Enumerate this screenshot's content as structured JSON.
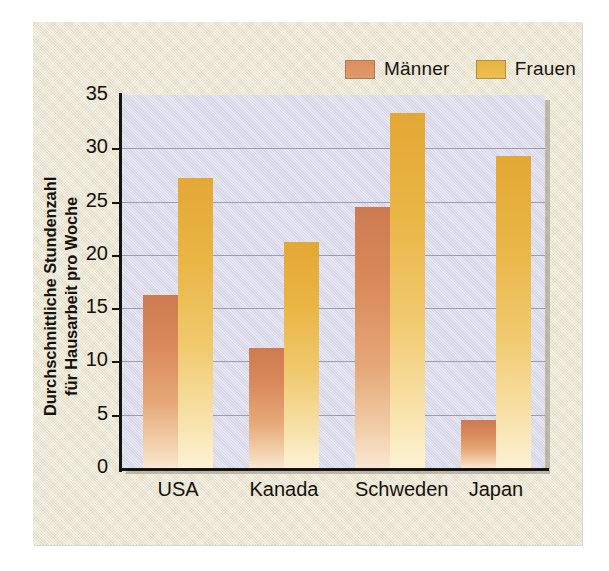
{
  "chart_data": {
    "type": "bar",
    "title": "",
    "xlabel": "",
    "ylabel": "Durchschnittliche Stundenzahl für Hausarbeit pro Woche",
    "ylabel_line1": "Durchschnittliche Stundenzahl",
    "ylabel_line2": "für Hausarbeit pro Woche",
    "categories": [
      "USA",
      "Kanada",
      "Schweden",
      "Japan"
    ],
    "series": [
      {
        "name": "Männer",
        "color": "#d98a5c",
        "values": [
          16.2,
          11.3,
          24.5,
          4.5
        ]
      },
      {
        "name": "Frauen",
        "color": "#e9b53f",
        "values": [
          27.2,
          21.2,
          33.3,
          29.3
        ]
      }
    ],
    "ylim": [
      0,
      35
    ],
    "yticks": [
      0,
      5,
      10,
      15,
      20,
      25,
      30,
      35
    ],
    "ytick_labels": [
      "0",
      "5",
      "10",
      "15",
      "20",
      "25",
      "30",
      "35"
    ],
    "grid": true,
    "legend_position": "top-right",
    "plot_background": "#dcdcec",
    "panel_background": "#ece5cf"
  },
  "legend": {
    "entries": [
      {
        "label": "Männer",
        "color": "#d98a5c"
      },
      {
        "label": "Frauen",
        "color": "#e9b53f"
      }
    ]
  }
}
